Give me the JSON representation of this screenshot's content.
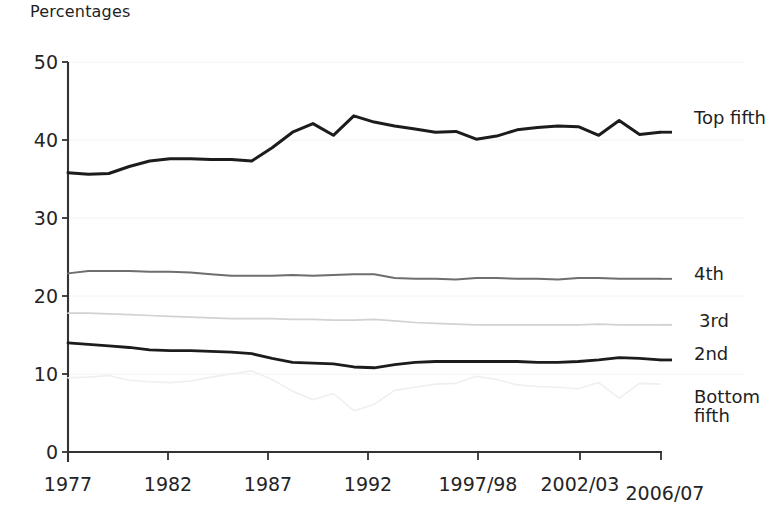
{
  "axis": {
    "unit_label": "Percentages",
    "y_ticks": [
      "0",
      "10",
      "20",
      "30",
      "40",
      "50"
    ],
    "x_ticks": [
      "1977",
      "1982",
      "1987",
      "1992",
      "1997/98",
      "2002/03",
      "2006/07"
    ]
  },
  "series_labels": [
    {
      "text": "Top fifth"
    },
    {
      "text": "4th"
    },
    {
      "text": "3rd"
    },
    {
      "text": "2nd"
    },
    {
      "text_line1": "Bottom",
      "text_line2": "fifth"
    }
  ],
  "colors": {
    "top_fifth": "#1c1c1c",
    "fourth": "#6e6e6e",
    "third": "#d2d2d2",
    "second": "#1c1c1c",
    "bottom_fifth": "#efefef",
    "axis": "#333333",
    "grid": "#f2f2f2"
  },
  "chart_data": {
    "type": "line",
    "title": "",
    "subtitle": "",
    "xlabel": "",
    "ylabel": "Percentages",
    "ylim": [
      0,
      50
    ],
    "grid": true,
    "legend_position": "right-inline",
    "x_tick_labels": [
      "1977",
      "1982",
      "1987",
      "1992",
      "1997/98",
      "2002/03",
      "2006/07"
    ],
    "x_tick_values": [
      1977,
      1982,
      1987,
      1992,
      1997,
      2002,
      2006
    ],
    "x": [
      1977,
      1978,
      1979,
      1980,
      1981,
      1982,
      1983,
      1984,
      1985,
      1986,
      1987,
      1988,
      1989,
      1990,
      1991,
      1992,
      1993,
      1994,
      1995,
      1996,
      1997,
      1998,
      1999,
      2000,
      2001,
      2002,
      2003,
      2004,
      2005,
      2006
    ],
    "x_labels_full": [
      "1977",
      "1978",
      "1979",
      "1980",
      "1981",
      "1982",
      "1983",
      "1984",
      "1985",
      "1986",
      "1987",
      "1988",
      "1989",
      "1990",
      "1991",
      "1992",
      "1993/94",
      "1994/95",
      "1995/96",
      "1996/97",
      "1997/98",
      "1998/99",
      "1999/00",
      "2000/01",
      "2001/02",
      "2002/03",
      "2003/04",
      "2004/05",
      "2005/06",
      "2006/07"
    ],
    "series": [
      {
        "name": "Top fifth",
        "color": "#1c1c1c",
        "values": [
          35.8,
          35.6,
          35.7,
          36.6,
          37.3,
          37.6,
          37.6,
          37.5,
          37.5,
          37.3,
          39.0,
          41.0,
          42.1,
          40.6,
          43.1,
          42.3,
          41.8,
          41.4,
          41.0,
          41.1,
          40.1,
          40.5,
          41.3,
          41.6,
          41.8,
          41.7,
          40.6,
          42.5,
          40.7,
          41.0
        ]
      },
      {
        "name": "4th",
        "color": "#6e6e6e",
        "values": [
          22.9,
          23.2,
          23.2,
          23.2,
          23.1,
          23.1,
          23.0,
          22.8,
          22.6,
          22.6,
          22.6,
          22.7,
          22.6,
          22.7,
          22.8,
          22.8,
          22.3,
          22.2,
          22.2,
          22.1,
          22.3,
          22.3,
          22.2,
          22.2,
          22.1,
          22.3,
          22.3,
          22.2,
          22.2,
          22.2
        ]
      },
      {
        "name": "3rd",
        "color": "#d2d2d2",
        "values": [
          17.8,
          17.8,
          17.7,
          17.6,
          17.5,
          17.4,
          17.3,
          17.2,
          17.1,
          17.1,
          17.1,
          17.0,
          17.0,
          16.9,
          16.9,
          17.0,
          16.8,
          16.6,
          16.5,
          16.4,
          16.3,
          16.3,
          16.3,
          16.3,
          16.3,
          16.3,
          16.4,
          16.3,
          16.3,
          16.3
        ]
      },
      {
        "name": "2nd",
        "color": "#1c1c1c",
        "values": [
          14.0,
          13.8,
          13.6,
          13.4,
          13.1,
          13.0,
          13.0,
          12.9,
          12.8,
          12.6,
          12.0,
          11.5,
          11.4,
          11.3,
          10.9,
          10.8,
          11.2,
          11.5,
          11.6,
          11.6,
          11.6,
          11.6,
          11.6,
          11.5,
          11.5,
          11.6,
          11.8,
          12.1,
          12.0,
          11.8
        ]
      },
      {
        "name": "Bottom fifth",
        "color": "#efefef",
        "values": [
          9.5,
          9.6,
          9.8,
          9.2,
          9.0,
          8.9,
          9.1,
          9.6,
          10.0,
          10.4,
          9.3,
          7.8,
          6.7,
          7.5,
          5.3,
          6.1,
          7.9,
          8.3,
          8.7,
          8.8,
          9.7,
          9.3,
          8.6,
          8.4,
          8.3,
          8.1,
          8.9,
          6.9,
          8.8,
          8.7
        ]
      }
    ]
  }
}
